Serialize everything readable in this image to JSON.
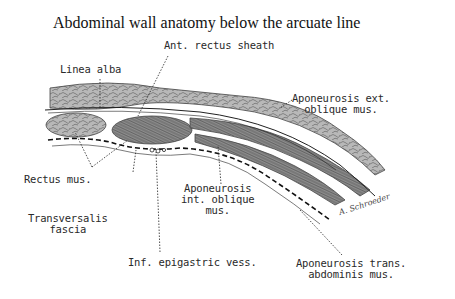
{
  "title": "Abdominal wall anatomy below the arcuate line",
  "labels": {
    "ant_rectus_sheath": "Ant. rectus sheath",
    "linea_alba": "Linea alba",
    "aponeurosis_ext_oblique": [
      "Aponeurosis ext.",
      "oblique mus."
    ],
    "rectus_mus": "Rectus mus.",
    "transversalis_fascia": [
      "Transversalis",
      "fascia"
    ],
    "aponeurosis_int_oblique": [
      "Aponeurosis",
      "int. oblique",
      "mus."
    ],
    "inf_epigastric_vess": "Inf. epigastric vess.",
    "aponeurosis_trans_abdominis": [
      "Aponeurosis trans.",
      "abdominis mus."
    ]
  },
  "signature": "A. Schroeder",
  "colors": {
    "ink": "#2a2a2a",
    "muscle_fill": "#8a8a8a",
    "fat_fill": "#b5b5b5",
    "background": "#ffffff"
  }
}
